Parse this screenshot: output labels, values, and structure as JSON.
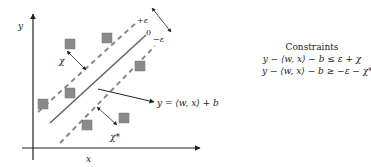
{
  "axes": {
    "x_label": "x",
    "y_label": "y"
  },
  "tube_labels": {
    "upper": "+ε",
    "center": "0",
    "lower": "−ε"
  },
  "slack_labels": {
    "upper": "χ",
    "lower": "χ*"
  },
  "regression_label": "y = ⟨w, x⟩ + b",
  "constraints": {
    "title": "Constraints",
    "eq1": "y − ⟨w, x⟩ − b ≤ ε + χ",
    "eq2": "y − ⟨w, x⟩ − b ≥ −ε − χ*"
  },
  "colors": {
    "line": "#333333",
    "dashed": "#888888",
    "point_fill": "#8a8a8a"
  },
  "points": [
    {
      "x": 70,
      "y": 44
    },
    {
      "x": 107,
      "y": 38
    },
    {
      "x": 140,
      "y": 66
    },
    {
      "x": 70,
      "y": 93
    },
    {
      "x": 43,
      "y": 104
    },
    {
      "x": 87,
      "y": 125
    },
    {
      "x": 124,
      "y": 118
    }
  ]
}
